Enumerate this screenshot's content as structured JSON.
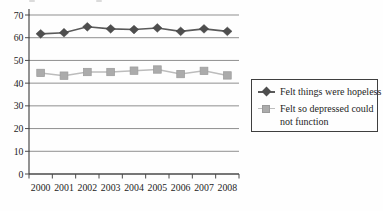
{
  "page": {
    "background": "#fefefe"
  },
  "colors": {
    "gridline": "#8f8f8f",
    "axis": "#4a4a4a",
    "text": "#1c1c1c",
    "legend_border": "#3f3f3f",
    "series1": "#4e4e4e",
    "series2_fill": "#ababab",
    "series2_line": "#bcbcbc",
    "background": "#fefefe"
  },
  "chart_data": {
    "type": "line",
    "title": "",
    "xlabel": "",
    "ylabel": "",
    "categories": [
      "2000",
      "2001",
      "2002",
      "2003",
      "2004",
      "2005",
      "2006",
      "2007",
      "2008"
    ],
    "series": [
      {
        "name": "Felt things were hopeless",
        "marker": "diamond",
        "color": "#4e4e4e",
        "line_color": "#5a5a5a",
        "values": [
          61.7,
          62.2,
          64.8,
          63.9,
          63.6,
          64.3,
          62.8,
          63.9,
          62.8
        ]
      },
      {
        "name": "Felt so depressed could not function",
        "marker": "square",
        "color": "#ababab",
        "line_color": "#bcbcbc",
        "values": [
          44.5,
          43.3,
          44.9,
          44.9,
          45.5,
          46.0,
          44.0,
          45.4,
          43.4
        ]
      }
    ],
    "ylim": [
      0,
      70
    ],
    "ytick_step": 10,
    "ytick_labels": [
      "0",
      "10",
      "20",
      "30",
      "40",
      "50",
      "60",
      "70"
    ],
    "grid": true,
    "legend_position": "right"
  }
}
